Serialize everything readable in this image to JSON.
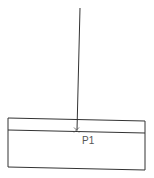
{
  "diagram": {
    "point_label": "P1",
    "colors": {
      "line": "#333333",
      "label": "#555555",
      "background": "#ffffff"
    },
    "vertical_line": {
      "x1": 80,
      "y1": 8,
      "x2": 77,
      "y2": 130
    },
    "rectangle": {
      "x": 8,
      "y": 118,
      "width": 137,
      "height": 52
    },
    "inner_line": {
      "x1": 8,
      "y1": 130,
      "x2": 145,
      "y2": 133
    },
    "point": {
      "x": 77,
      "y": 130
    }
  }
}
